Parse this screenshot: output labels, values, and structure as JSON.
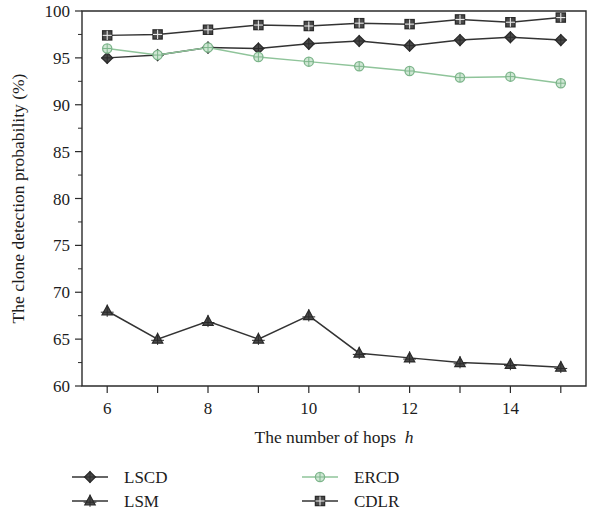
{
  "chart_data": {
    "type": "line",
    "title": "",
    "xlabel": "The number of hops h",
    "xlabel_plain": "The number of hops",
    "xlabel_italic": "h",
    "ylabel": "The clone detection probability (%)",
    "x": [
      6,
      7,
      8,
      9,
      10,
      11,
      12,
      13,
      14,
      15
    ],
    "xlim": [
      5.5,
      15.5
    ],
    "ylim": [
      60,
      100
    ],
    "xticks": [
      6,
      7,
      8,
      9,
      10,
      11,
      12,
      13,
      14,
      15
    ],
    "xtick_labels": [
      "6",
      "",
      "8",
      "",
      "10",
      "",
      "12",
      "",
      "14",
      ""
    ],
    "yticks": [
      60,
      65,
      70,
      75,
      80,
      85,
      90,
      95,
      100
    ],
    "ytick_labels": [
      "60",
      "65",
      "70",
      "75",
      "80",
      "85",
      "90",
      "95",
      "100"
    ],
    "grid": false,
    "legend_position": "below-plot",
    "series": [
      {
        "name": "LSCD",
        "marker": "diamond",
        "color": "#333333",
        "values": [
          95.0,
          95.3,
          96.1,
          96.0,
          96.5,
          96.8,
          96.3,
          96.9,
          97.2,
          96.9
        ]
      },
      {
        "name": "LSM",
        "marker": "triangle",
        "color": "#333333",
        "values": [
          68.0,
          65.0,
          66.9,
          65.0,
          67.5,
          63.5,
          63.0,
          62.5,
          62.3,
          62.0
        ]
      },
      {
        "name": "ERCD",
        "marker": "circle",
        "color": "#8fc49a",
        "values": [
          96.0,
          95.3,
          96.1,
          95.1,
          94.6,
          94.1,
          93.6,
          92.9,
          93.0,
          92.3
        ]
      },
      {
        "name": "CDLR",
        "marker": "square",
        "color": "#333333",
        "values": [
          97.4,
          97.5,
          98.0,
          98.5,
          98.4,
          98.7,
          98.6,
          99.1,
          98.8,
          99.3
        ]
      }
    ]
  },
  "legend": {
    "entries": [
      {
        "label": "LSCD",
        "marker": "diamond",
        "color": "#333333"
      },
      {
        "label": "ERCD",
        "marker": "circle",
        "color": "#8fc49a"
      },
      {
        "label": "LSM",
        "marker": "triangle",
        "color": "#333333"
      },
      {
        "label": "CDLR",
        "marker": "square",
        "color": "#333333"
      }
    ]
  },
  "colors": {
    "axis": "#2b2b2b",
    "text": "#1c1c1c",
    "dark_series": "#333333",
    "green_series": "#8fc49a",
    "background": "#ffffff"
  }
}
